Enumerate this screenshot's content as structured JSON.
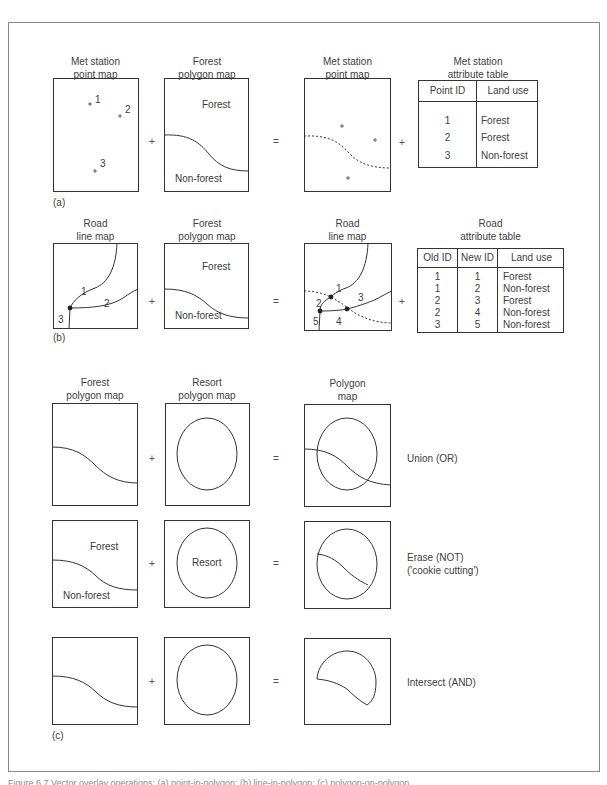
{
  "panel_a": {
    "label": "(a)",
    "input1_title": [
      "Met station",
      "point map"
    ],
    "input2_title": [
      "Forest",
      "polygon map"
    ],
    "output_title": [
      "Met station",
      "point map"
    ],
    "table_title": [
      "Met station",
      "attribute table"
    ],
    "point_labels": [
      "1",
      "2",
      "3"
    ],
    "forest_label": "Forest",
    "nonforest_label": "Non-forest",
    "plus": "+",
    "equals": "=",
    "table": {
      "headers": [
        "Point ID",
        "Land use"
      ],
      "rows": [
        [
          "1",
          "Forest"
        ],
        [
          "2",
          "Forest"
        ],
        [
          "3",
          "Non-forest"
        ]
      ]
    }
  },
  "panel_b": {
    "label": "(b)",
    "input1_title": [
      "Road",
      "line map"
    ],
    "input2_title": [
      "Forest",
      "polygon map"
    ],
    "output_title": [
      "Road",
      "line map"
    ],
    "table_title": [
      "Road",
      "attribute table"
    ],
    "input_line_labels": [
      "1",
      "2",
      "3"
    ],
    "output_line_labels": [
      "1",
      "2",
      "3",
      "4",
      "5"
    ],
    "forest_label": "Forest",
    "nonforest_label": "Non-forest",
    "plus": "+",
    "equals": "=",
    "table": {
      "headers": [
        "Old ID",
        "New ID",
        "Land use"
      ],
      "rows": [
        [
          "1",
          "1",
          "Forest"
        ],
        [
          "1",
          "2",
          "Non-forest"
        ],
        [
          "2",
          "3",
          "Forest"
        ],
        [
          "2",
          "4",
          "Non-forest"
        ],
        [
          "3",
          "5",
          "Non-forest"
        ]
      ]
    }
  },
  "panel_c": {
    "label": "(c)",
    "input1_title": [
      "Forest",
      "polygon map"
    ],
    "input2_title": [
      "Resort",
      "polygon map"
    ],
    "output_title": [
      "Polygon",
      "map"
    ],
    "plus": "+",
    "equals": "=",
    "rows": [
      {
        "operation": [
          "Union (OR)"
        ]
      },
      {
        "operation": [
          "Erase (NOT)",
          "('cookie cutting')"
        ],
        "forest_label": "Forest",
        "nonforest_label": "Non-forest",
        "resort_label": "Resort"
      },
      {
        "operation": [
          "Intersect (AND)"
        ]
      }
    ]
  },
  "caption": "Figure 6.7  Vector overlay operations: (a) point-in-polygon; (b) line-in-polygon; (c) polygon-on-polygon"
}
